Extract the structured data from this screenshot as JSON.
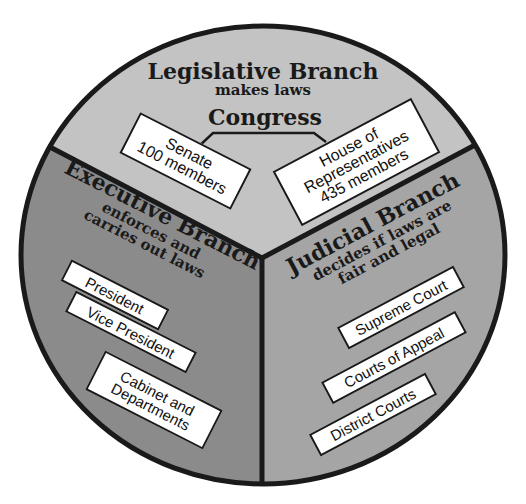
{
  "diagram": {
    "colors": {
      "legislative": "#c3c3c3",
      "executive": "#8b8b8b",
      "judicial": "#a5a5a5",
      "outline": "#1a1a1a",
      "box_fill": "#ffffff",
      "background": "#ffffff"
    },
    "legislative": {
      "title": "Legislative Branch",
      "subtitle": "makes laws",
      "body": "Congress",
      "boxes": [
        {
          "line1": "Senate",
          "line2": "100 members"
        },
        {
          "line1": "House of",
          "line2": "Representatives",
          "line3": "435 members"
        }
      ]
    },
    "executive": {
      "title": "Executive Branch",
      "subtitle_line1": "enforces and",
      "subtitle_line2": "carries out laws",
      "boxes": [
        {
          "line1": "President"
        },
        {
          "line1": "Vice President"
        },
        {
          "line1": "Cabinet and",
          "line2": "Departments"
        }
      ]
    },
    "judicial": {
      "title": "Judicial Branch",
      "subtitle_line1": "decides if laws are",
      "subtitle_line2": "fair and legal",
      "boxes": [
        {
          "line1": "Supreme Court"
        },
        {
          "line1": "Courts of Appeal"
        },
        {
          "line1": "District Courts"
        }
      ]
    }
  }
}
